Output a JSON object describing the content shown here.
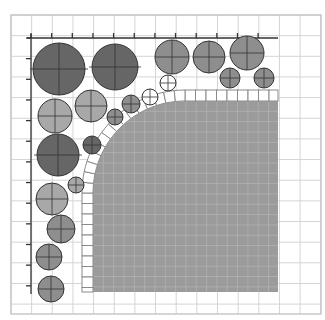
{
  "diagram": {
    "title": "",
    "colors": {
      "background": "#ffffff",
      "grid_line": "#d4d4d4",
      "frame_line": "#c8c8c8",
      "axis_line": "#333333",
      "bed_fill": "#9b9b9b",
      "bed_grid": "#b4b4b4",
      "brick_fill": "#ffffff",
      "brick_stroke": "#8a8a8a",
      "plant_dark": "#666666",
      "plant_medium": "#8e8e8e",
      "plant_light": "#a8a8a8",
      "plant_white": "#ffffff",
      "plant_stroke": "#333333"
    },
    "grid": {
      "x0": 11,
      "y0": 15,
      "x1": 321,
      "y1": 314,
      "step": 20.65
    },
    "axes": {
      "top": {
        "y": 38,
        "x_start": 27,
        "x_end": 278,
        "tick_count": 13
      },
      "left": {
        "x": 31,
        "y_start": 34,
        "y_end": 294,
        "tick_count": 13
      }
    },
    "bed": {
      "x": 93,
      "y": 101,
      "width": 185,
      "height": 191,
      "corner_radius": 92
    },
    "brick_border": {
      "thickness": 11,
      "brick_length": 10.5
    },
    "plants": [
      {
        "cx": 59,
        "cy": 69,
        "r": 26,
        "tone": "dark",
        "cross": true
      },
      {
        "cx": 115,
        "cy": 67,
        "r": 23,
        "tone": "dark",
        "cross": true
      },
      {
        "cx": 172,
        "cy": 57,
        "r": 17,
        "tone": "medium",
        "cross": true
      },
      {
        "cx": 209,
        "cy": 57,
        "r": 16,
        "tone": "medium",
        "cross": true
      },
      {
        "cx": 247,
        "cy": 53,
        "r": 17,
        "tone": "medium",
        "cross": true
      },
      {
        "cx": 230,
        "cy": 78,
        "r": 10,
        "tone": "medium",
        "cross": true
      },
      {
        "cx": 264,
        "cy": 78,
        "r": 10,
        "tone": "medium",
        "cross": true
      },
      {
        "cx": 168,
        "cy": 83,
        "r": 8,
        "tone": "white",
        "cross": true
      },
      {
        "cx": 150,
        "cy": 97,
        "r": 8,
        "tone": "white",
        "cross": true
      },
      {
        "cx": 55,
        "cy": 116,
        "r": 17,
        "tone": "light",
        "cross": true
      },
      {
        "cx": 91,
        "cy": 106,
        "r": 16,
        "tone": "light",
        "cross": true
      },
      {
        "cx": 131,
        "cy": 104,
        "r": 9,
        "tone": "medium",
        "cross": true
      },
      {
        "cx": 115,
        "cy": 117,
        "r": 8,
        "tone": "medium",
        "cross": true
      },
      {
        "cx": 92,
        "cy": 145,
        "r": 9,
        "tone": "dark",
        "cross": true
      },
      {
        "cx": 58,
        "cy": 155,
        "r": 21,
        "tone": "dark",
        "cross": true
      },
      {
        "cx": 76,
        "cy": 185,
        "r": 8,
        "tone": "light",
        "cross": true
      },
      {
        "cx": 52,
        "cy": 199,
        "r": 16,
        "tone": "light",
        "cross": true
      },
      {
        "cx": 61,
        "cy": 229,
        "r": 14,
        "tone": "medium",
        "cross": true
      },
      {
        "cx": 49,
        "cy": 257,
        "r": 13,
        "tone": "medium",
        "cross": true
      },
      {
        "cx": 51,
        "cy": 289,
        "r": 13,
        "tone": "medium",
        "cross": true
      }
    ]
  }
}
